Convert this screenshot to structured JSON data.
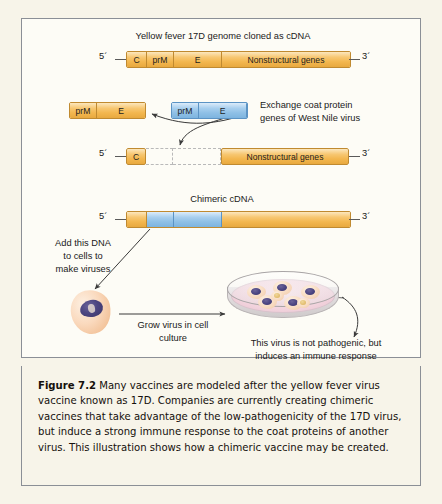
{
  "figure": {
    "number_label": "Figure 7.2",
    "caption_text": " Many vaccines are modeled after the yellow fever virus vaccine known as 17D. Companies are currently creating chimeric vaccines that take advantage of the low-pathogenicity of the 17D virus, but induce a strong immune response to the coat proteins of another virus. This illustration shows how a chimeric vaccine may be created."
  },
  "diagram": {
    "top_title": "Yellow fever 17D genome cloned as cDNA",
    "chimeric_title": "Chimeric cDNA",
    "exchange_note_line1": "Exchange coat protein",
    "exchange_note_line2": "genes of West Nile virus",
    "add_dna_line1": "Add this DNA",
    "add_dna_line2": "to cells to",
    "add_dna_line3": "make viruses",
    "grow_line1": "Grow virus in cell",
    "grow_line2": "culture",
    "outcome_line1": "This virus is not pathogenic, but",
    "outcome_line2": "induces an immune response",
    "five_prime": "5´",
    "three_prime": "3´",
    "genome_segments": [
      {
        "label": "C",
        "width": 20,
        "color": "orange"
      },
      {
        "label": "prM",
        "width": 27,
        "color": "orange"
      },
      {
        "label": "E",
        "width": 48,
        "color": "orange"
      },
      {
        "label": "Nonstructural genes",
        "width": 128,
        "color": "orange"
      }
    ],
    "yf_fragment_segments": [
      {
        "label": "prM",
        "width": 27,
        "color": "orange"
      },
      {
        "label": "E",
        "width": 48,
        "color": "orange"
      }
    ],
    "wn_fragment_segments": [
      {
        "label": "prM",
        "width": 27,
        "color": "blue"
      },
      {
        "label": "E",
        "width": 48,
        "color": "blue"
      }
    ],
    "gapped_segments": [
      {
        "label": "C",
        "width": 20,
        "color": "orange",
        "style": "solid"
      },
      {
        "label": "",
        "width": 27,
        "color": "none",
        "style": "empty"
      },
      {
        "label": "",
        "width": 48,
        "color": "none",
        "style": "empty"
      },
      {
        "label": "Nonstructural genes",
        "width": 128,
        "color": "orange",
        "style": "solid"
      }
    ],
    "chimeric_segments": [
      {
        "label": "",
        "width": 20,
        "color": "orange"
      },
      {
        "label": "",
        "width": 27,
        "color": "blue"
      },
      {
        "label": "",
        "width": 48,
        "color": "blue"
      },
      {
        "label": "",
        "width": 128,
        "color": "orange"
      }
    ]
  },
  "colors": {
    "orange_fill": "#f3b74f",
    "orange_border": "#c08a30",
    "blue_fill": "#8fc0e6",
    "blue_border": "#5b93c4",
    "panel_border": "#8b8f96",
    "page_background": "#f7f4e9",
    "panel_background": "#fdfcf6",
    "nucleus": "#4a4480",
    "medium_pink": "#f2d3dd"
  }
}
